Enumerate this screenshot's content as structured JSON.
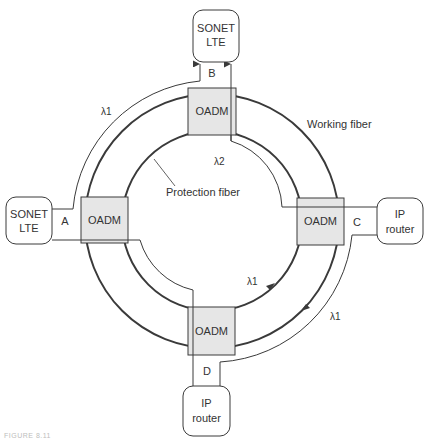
{
  "diagram": {
    "colors": {
      "line": "#3a3a3a",
      "oadm_fill": "#e6e6e6",
      "text": "#333333"
    },
    "endpoints": {
      "top": {
        "line1": "SONET",
        "line2": "LTE"
      },
      "left": {
        "line1": "SONET",
        "line2": "LTE"
      },
      "right": {
        "line1": "IP",
        "line2": "router"
      },
      "bottom": {
        "line1": "IP",
        "line2": "router"
      }
    },
    "nodes": {
      "top": "OADM",
      "left": "OADM",
      "right": "OADM",
      "bottom": "OADM"
    },
    "port_labels": {
      "a": "A",
      "b": "B",
      "c": "C",
      "d": "D"
    },
    "fiber_labels": {
      "working": "Working fiber",
      "protection": "Protection fiber"
    },
    "wavelengths": {
      "ab": "λ1",
      "protection_top": "λ2",
      "protection_bottom": "λ1",
      "cd": "λ1"
    },
    "caption": "FIGURE 8.11"
  }
}
